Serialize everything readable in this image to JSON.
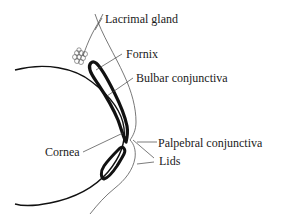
{
  "labels": {
    "lacrimal_gland": "Lacrimal gland",
    "fornix": "Fornix",
    "bulbar_conjunctiva": "Bulbar conjunctiva",
    "palpebral_conjunctiva": "Palpebral conjunctiva",
    "cornea": "Cornea",
    "lids": "Lids"
  },
  "colors": {
    "stroke": "#111111",
    "thin_stroke": "#444444",
    "background": "#ffffff"
  }
}
